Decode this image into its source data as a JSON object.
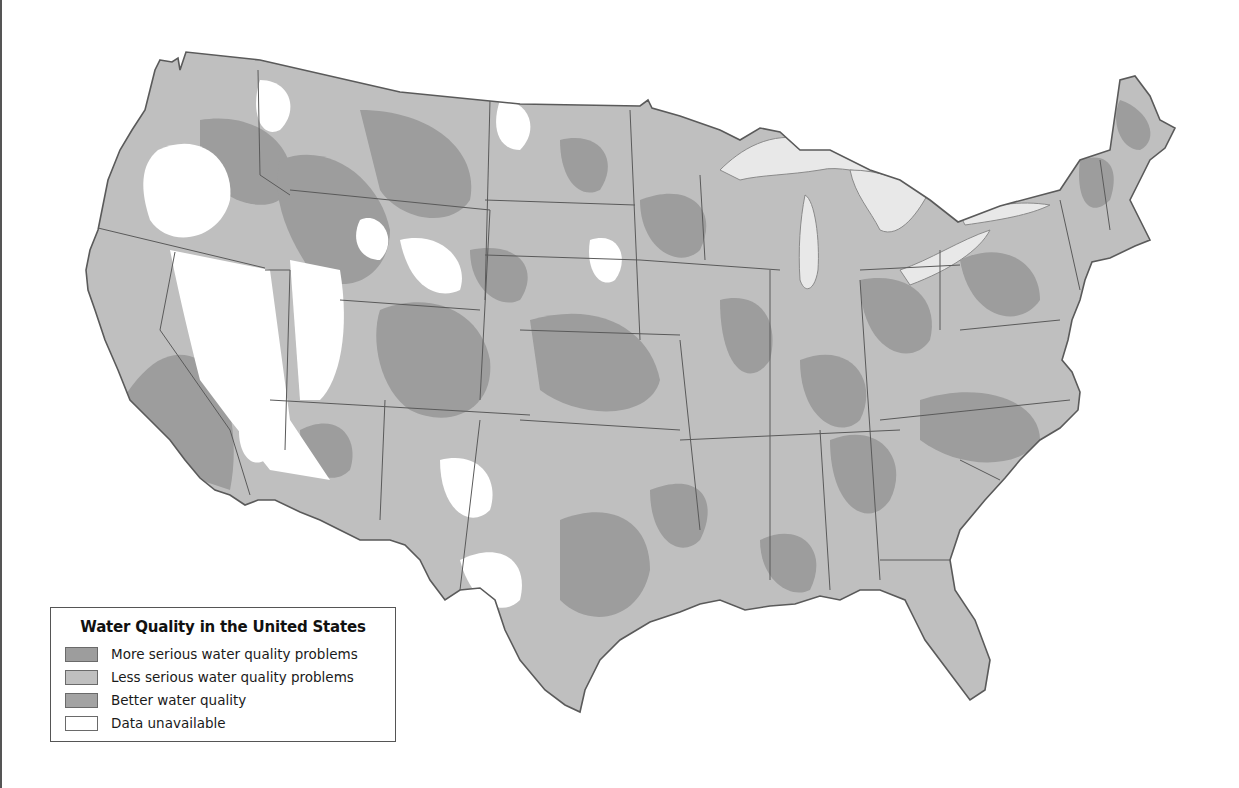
{
  "map": {
    "title": "Water Quality in the United States",
    "colors": {
      "more_serious": "#9d9d9d",
      "less_serious": "#bfbfbf",
      "better": "#a3a3a3",
      "unavailable": "#ffffff",
      "water": "#e8e8e8",
      "border": "#5a5a5a"
    }
  },
  "legend": {
    "title": "Water Quality in the United States",
    "items": [
      {
        "label": "More serious water quality problems",
        "color": "#9d9d9d"
      },
      {
        "label": "Less serious water quality problems",
        "color": "#bfbfbf"
      },
      {
        "label": "Better water quality",
        "color": "#a3a3a3"
      },
      {
        "label": "Data unavailable",
        "color": "#ffffff"
      }
    ]
  }
}
